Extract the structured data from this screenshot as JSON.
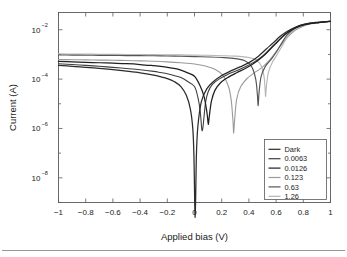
{
  "chart_data": {
    "type": "line",
    "title": "",
    "xlabel": "Applied bias (V)",
    "ylabel": "Current (A)",
    "xlim": [
      -1,
      1
    ],
    "ylim": [
      1e-09,
      0.05
    ],
    "yscale": "log",
    "grid": false,
    "legend_position": "lower right",
    "xticks": [
      -1,
      -0.8,
      -0.6,
      -0.4,
      -0.2,
      0,
      0.2,
      0.4,
      0.6,
      0.8,
      1
    ],
    "xticklabels": [
      "−1",
      "−0.8",
      "−0.6",
      "−0.4",
      "−0.2",
      "0",
      "0.2",
      "0.4",
      "0.6",
      "0.8",
      "1"
    ],
    "yticks": [
      0.01,
      0.0001,
      1e-06,
      1e-08
    ],
    "yticklabels": [
      {
        "mantissa": "10",
        "exponent": "−2"
      },
      {
        "mantissa": "10",
        "exponent": "−4"
      },
      {
        "mantissa": "10",
        "exponent": "−6"
      },
      {
        "mantissa": "10",
        "exponent": "−8"
      }
    ],
    "series": [
      {
        "name": "Dark",
        "color": "#2b2b2b",
        "width": 1.25,
        "dip_v": 0.005,
        "dip_i": 2.5e-10,
        "left_i": 0.00036,
        "knee_v": 0.62,
        "right_i": 0.022,
        "x": [
          -1,
          -0.9,
          -0.8,
          -0.7,
          -0.6,
          -0.5,
          -0.4,
          -0.3,
          -0.25,
          -0.2,
          -0.15,
          -0.1,
          -0.06,
          -0.03,
          -0.012,
          -0.004,
          0.005,
          0.014,
          0.024,
          0.05,
          0.09,
          0.14,
          0.2,
          0.27,
          0.34,
          0.41,
          0.47,
          0.53,
          0.58,
          0.63,
          0.68,
          0.74,
          0.8,
          0.86,
          0.92,
          1
        ],
        "y": [
          0.00036,
          0.00033,
          0.0003,
          0.00027,
          0.00024,
          0.00021,
          0.00018,
          0.000145,
          0.000125,
          0.000105,
          8e-05,
          5e-05,
          2.2e-05,
          6e-06,
          9e-07,
          7e-08,
          2.5e-10,
          8e-08,
          1.1e-06,
          1.2e-05,
          4e-05,
          8e-05,
          0.00014,
          0.00022,
          0.00032,
          0.0005,
          0.00085,
          0.0017,
          0.003,
          0.0054,
          0.0085,
          0.0125,
          0.016,
          0.0185,
          0.02,
          0.022
        ]
      },
      {
        "name": "0.0063",
        "color": "#3f3f3f",
        "width": 1.1,
        "dip_v": 0.062,
        "dip_i": 1.1e-06,
        "left_i": 0.00042,
        "knee_v": 0.62,
        "right_i": 0.022,
        "x": [
          -1,
          -0.9,
          -0.8,
          -0.7,
          -0.6,
          -0.5,
          -0.4,
          -0.3,
          -0.25,
          -0.2,
          -0.15,
          -0.1,
          -0.05,
          0,
          0.025,
          0.042,
          0.054,
          0.062,
          0.07,
          0.082,
          0.1,
          0.13,
          0.18,
          0.24,
          0.3,
          0.37,
          0.44,
          0.5,
          0.56,
          0.61,
          0.66,
          0.72,
          0.78,
          0.85,
          0.92,
          1
        ],
        "y": [
          0.00042,
          0.00039,
          0.00036,
          0.00033,
          0.0003,
          0.00027,
          0.00024,
          0.000205,
          0.000185,
          0.000165,
          0.00014,
          0.000115,
          8e-05,
          5e-05,
          1.8e-05,
          5e-06,
          9e-07,
          1.1e-06,
          3e-06,
          1.2e-05,
          3e-05,
          6e-05,
          0.0001,
          0.00015,
          0.00021,
          0.00031,
          0.0005,
          0.00085,
          0.0018,
          0.0034,
          0.0062,
          0.0105,
          0.0145,
          0.0178,
          0.0198,
          0.022
        ]
      },
      {
        "name": "0.0126",
        "color": "#1f1f1f",
        "width": 1.25,
        "dip_v": 0.103,
        "dip_i": 1.6e-06,
        "left_i": 0.00052,
        "knee_v": 0.63,
        "right_i": 0.022,
        "x": [
          -1,
          -0.9,
          -0.8,
          -0.7,
          -0.6,
          -0.5,
          -0.4,
          -0.3,
          -0.25,
          -0.2,
          -0.15,
          -0.1,
          -0.05,
          0,
          0.04,
          0.07,
          0.09,
          0.1,
          0.103,
          0.11,
          0.125,
          0.15,
          0.19,
          0.25,
          0.31,
          0.38,
          0.44,
          0.5,
          0.56,
          0.61,
          0.66,
          0.72,
          0.78,
          0.85,
          0.92,
          1
        ],
        "y": [
          0.00052,
          0.0005,
          0.00048,
          0.00046,
          0.00044,
          0.00042,
          0.00039,
          0.00035,
          0.00033,
          0.0003,
          0.00027,
          0.00023,
          0.00018,
          0.00013,
          5.5e-05,
          2e-05,
          5e-06,
          1.7e-06,
          1.6e-06,
          3.5e-06,
          1.3e-05,
          3.5e-05,
          7e-05,
          0.00012,
          0.00018,
          0.00028,
          0.00045,
          0.0008,
          0.0017,
          0.0032,
          0.006,
          0.0103,
          0.0144,
          0.0178,
          0.0198,
          0.022
        ]
      },
      {
        "name": "0.123",
        "color": "#9a9a9a",
        "width": 1.1,
        "dip_v": 0.288,
        "dip_i": 6.5e-07,
        "left_i": 0.00062,
        "knee_v": 0.66,
        "right_i": 0.022,
        "x": [
          -1,
          -0.9,
          -0.8,
          -0.7,
          -0.6,
          -0.5,
          -0.4,
          -0.3,
          -0.2,
          -0.1,
          0,
          0.08,
          0.15,
          0.21,
          0.25,
          0.27,
          0.283,
          0.288,
          0.295,
          0.31,
          0.34,
          0.39,
          0.44,
          0.49,
          0.54,
          0.59,
          0.64,
          0.69,
          0.74,
          0.8,
          0.86,
          0.92,
          1
        ],
        "y": [
          0.00062,
          0.00061,
          0.0006,
          0.00059,
          0.00058,
          0.000565,
          0.00055,
          0.00053,
          0.0005,
          0.00046,
          0.00041,
          0.00034,
          0.00025,
          0.00014,
          5e-05,
          1.4e-05,
          2e-06,
          6.5e-07,
          2.2e-06,
          1.5e-05,
          5e-05,
          0.00011,
          0.00018,
          0.00028,
          0.0005,
          0.0011,
          0.0026,
          0.0054,
          0.0095,
          0.014,
          0.0175,
          0.0195,
          0.022
        ]
      },
      {
        "name": "0.63",
        "color": "#555555",
        "width": 1.15,
        "dip_v": 0.468,
        "dip_i": 8.5e-06,
        "left_i": 0.00095,
        "knee_v": 0.68,
        "right_i": 0.022,
        "x": [
          -1,
          -0.9,
          -0.8,
          -0.7,
          -0.6,
          -0.5,
          -0.4,
          -0.3,
          -0.2,
          -0.1,
          0,
          0.1,
          0.2,
          0.3,
          0.37,
          0.42,
          0.45,
          0.462,
          0.468,
          0.475,
          0.49,
          0.52,
          0.56,
          0.6,
          0.64,
          0.68,
          0.73,
          0.78,
          0.84,
          0.9,
          0.95,
          1
        ],
        "y": [
          0.00095,
          0.00094,
          0.00093,
          0.00092,
          0.00091,
          0.0009,
          0.00089,
          0.00088,
          0.00086,
          0.00084,
          0.00082,
          0.00079,
          0.00075,
          0.00068,
          0.00055,
          0.00032,
          0.0001,
          2.5e-05,
          8.5e-06,
          3e-05,
          0.00013,
          0.00032,
          0.0006,
          0.0012,
          0.0028,
          0.006,
          0.011,
          0.0155,
          0.0185,
          0.0202,
          0.0212,
          0.022
        ]
      },
      {
        "name": "1.26",
        "color": "#b5b5b5",
        "width": 1.1,
        "dip_v": 0.523,
        "dip_i": 2e-05,
        "left_i": 0.00105,
        "knee_v": 0.69,
        "right_i": 0.022,
        "x": [
          -1,
          -0.9,
          -0.8,
          -0.7,
          -0.6,
          -0.5,
          -0.4,
          -0.3,
          -0.2,
          -0.1,
          0,
          0.1,
          0.2,
          0.3,
          0.4,
          0.45,
          0.49,
          0.51,
          0.518,
          0.523,
          0.53,
          0.545,
          0.57,
          0.6,
          0.64,
          0.68,
          0.73,
          0.78,
          0.84,
          0.9,
          0.95,
          1
        ],
        "y": [
          0.00105,
          0.00104,
          0.00103,
          0.00102,
          0.00101,
          0.001,
          0.00099,
          0.00098,
          0.00097,
          0.000955,
          0.00094,
          0.00092,
          0.00089,
          0.00085,
          0.00075,
          0.00062,
          0.00035,
          0.00014,
          5e-05,
          2e-05,
          6e-05,
          0.0002,
          0.00045,
          0.00085,
          0.002,
          0.0048,
          0.01,
          0.015,
          0.0183,
          0.02,
          0.021,
          0.022
        ]
      }
    ]
  },
  "legend": {
    "entries": [
      "Dark",
      "0.0063",
      "0.0126",
      "0.123",
      "0.63",
      "1.26"
    ]
  },
  "axes": {
    "xlabel": "Applied bias (V)",
    "ylabel": "Current (A)"
  }
}
